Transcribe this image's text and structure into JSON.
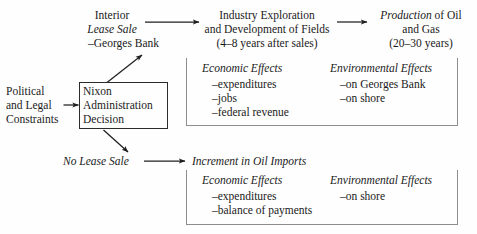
{
  "diagram": {
    "background_color": "#fefefe",
    "text_color": "#1a1a1a",
    "box_border_color": "#2b2b2b"
  },
  "inputs": {
    "constraints_line1": "Political",
    "constraints_line2": "and Legal",
    "constraints_line3": "Constraints"
  },
  "decision_box": {
    "line1": "Nixon",
    "line2": "Administration",
    "line3": "Decision"
  },
  "branch_lease": {
    "line1": "Interior",
    "line2": "Lease Sale",
    "line3": "–Georges Bank"
  },
  "branch_industry": {
    "line1": "Industry Exploration",
    "line2": "and Development of Fields",
    "line3": "(4–8 years after sales)"
  },
  "branch_production": {
    "line1_italic": "Production",
    "line1_rest": " of Oil",
    "line2": "and Gas",
    "line3": "(20–30 years)"
  },
  "branch_no_lease": {
    "label": "No Lease Sale"
  },
  "branch_imports": {
    "label": "Increment in Oil Imports"
  },
  "effects_upper": {
    "economic_title": "Economic Effects",
    "economic_items": [
      "–expenditures",
      "–jobs",
      "–federal revenue"
    ],
    "environmental_title": "Environmental Effects",
    "environmental_items": [
      "–on Georges Bank",
      "–on shore"
    ]
  },
  "effects_lower": {
    "economic_title": "Economic Effects",
    "economic_items": [
      "–expenditures",
      "–balance of payments"
    ],
    "environmental_title": "Environmental Effects",
    "environmental_items": [
      "–on shore"
    ]
  }
}
